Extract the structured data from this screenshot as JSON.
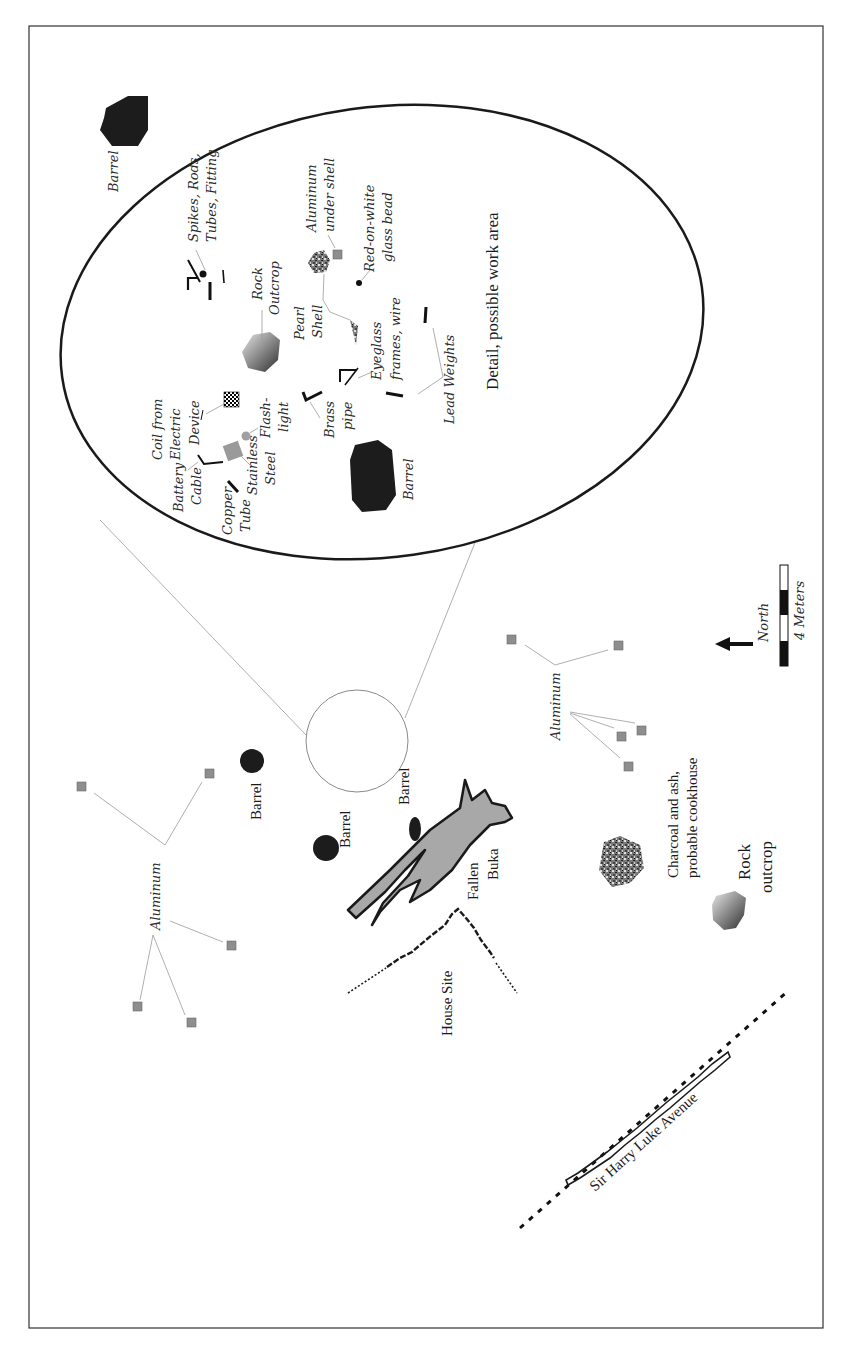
{
  "map": {
    "frame": {
      "x": 29,
      "y": 26,
      "width": 794,
      "height": 1302
    },
    "orientation": "rotated 90° (text reads bottom-to-top)",
    "colors": {
      "ink": "#1a1a1a",
      "barrel": "#1c1c1c",
      "aluminum": "#8e8e8e",
      "tree": "#a8a8a8",
      "leader": "#9a9a9a"
    },
    "detail_inset": {
      "title": "Detail, possible work area",
      "labels": {
        "barrel_top": "Barrel",
        "barrel_bottom": "Barrel",
        "spikes_1": "Spikes, Rods,",
        "spikes_2": "Tubes, Fitting",
        "rock_1": "Rock",
        "rock_2": "Outcrop",
        "coil_1": "Coil from",
        "coil_2": "Electric",
        "coil_3": "Device",
        "battery_1": "Battery",
        "battery_2": "Cable",
        "copper_1": "Copper",
        "copper_2": "Tube",
        "stainless_1": "Stainless",
        "stainless_2": "Steel",
        "flash_1": "Flash-",
        "flash_2": "light",
        "brass_1": "Brass",
        "brass_2": "pipe",
        "pearl_1": "Pearl",
        "pearl_2": "Shell",
        "eyeglass_1": "Eyeglass",
        "eyeglass_2": "frames, wire",
        "aluminum_1": "Aluminum",
        "aluminum_2": "under shell",
        "bead_1": "Red-on-white",
        "bead_2": "glass bead",
        "lead": "Lead Weights"
      }
    },
    "main_labels": {
      "barrel_1": "Barrel",
      "barrel_2": "Barrel",
      "barrel_3": "Barrel",
      "aluminum_left": "Aluminum",
      "aluminum_right": "Aluminum",
      "fallen_1": "Fallen",
      "fallen_2": "Buka",
      "house_site": "House Site",
      "charcoal_1": "Charcoal and ash,",
      "charcoal_2": "probable cookhouse",
      "rock_1": "Rock",
      "rock_2": "outcrop",
      "road": "Sir Harry Luke Avenue",
      "north": "North",
      "scale": "4 Meters"
    }
  }
}
